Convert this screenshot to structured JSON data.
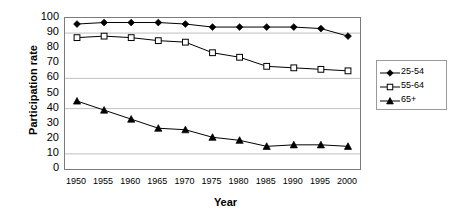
{
  "chart_data": {
    "type": "line",
    "title": "",
    "xlabel": "Year",
    "ylabel": "Participation rate",
    "categories": [
      1950,
      1955,
      1960,
      1965,
      1970,
      1975,
      1980,
      1985,
      1990,
      1995,
      2000
    ],
    "xticklabels": [
      "1950",
      "1955",
      "1960",
      "1965",
      "1970",
      "1975",
      "1980",
      "1985",
      "1990",
      "1995",
      "2000"
    ],
    "yticklabels": [
      "100",
      "90",
      "80",
      "70",
      "60",
      "50",
      "40",
      "30",
      "20",
      "10",
      "0"
    ],
    "ylim": [
      0,
      100
    ],
    "ytick_step": 10,
    "grid": true,
    "gridlines": [
      90,
      60,
      40,
      10
    ],
    "legend_position": "right",
    "series": [
      {
        "name": "25-54",
        "marker": "filled-diamond",
        "color": "#000000",
        "values": [
          96,
          97,
          97,
          97,
          96,
          94,
          94,
          94,
          94,
          93,
          88
        ]
      },
      {
        "name": "55-64",
        "marker": "open-square",
        "color": "#000000",
        "values": [
          87,
          88,
          87,
          85,
          84,
          77,
          74,
          68,
          67,
          66,
          65
        ]
      },
      {
        "name": "65+",
        "marker": "filled-triangle",
        "color": "#000000",
        "values": [
          45,
          39,
          33,
          27,
          26,
          21,
          19,
          15,
          16,
          16,
          15
        ]
      }
    ]
  },
  "axes": {
    "ylabel": "Participation rate",
    "xlabel": "Year"
  },
  "legend": {
    "items": [
      {
        "label": "25-54",
        "marker": "filled-diamond"
      },
      {
        "label": "55-64",
        "marker": "open-square"
      },
      {
        "label": "65+",
        "marker": "filled-triangle"
      }
    ]
  }
}
